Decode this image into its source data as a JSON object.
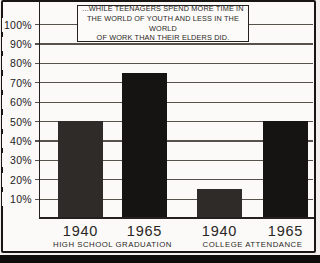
{
  "caption": {
    "full_text": "...WHILE TEENAGERS SPEND MORE TIME IN THE WORLD OF YOUTH AND LESS IN THE WORLD OF WORK THAN THEIR ELDERS DID."
  },
  "chart_data": {
    "type": "bar",
    "title": "...WHILE TEENAGERS SPEND MORE TIME IN THE WORLD OF YOUTH AND LESS IN THE WORLD OF WORK THAN THEIR ELDERS DID.",
    "title_lines": [
      "...WHILE TEENAGERS SPEND MORE TIME IN",
      "THE WORLD OF YOUTH AND LESS IN THE WORLD",
      "OF WORK THAN THEIR ELDERS DID."
    ],
    "groups": [
      {
        "label": "HIGH SCHOOL GRADUATION",
        "bars": [
          {
            "year": "1940",
            "value": 50
          },
          {
            "year": "1965",
            "value": 75
          }
        ]
      },
      {
        "label": "COLLEGE ATTENDANCE",
        "bars": [
          {
            "year": "1940",
            "value": 15
          },
          {
            "year": "1965",
            "value": 50
          }
        ]
      }
    ],
    "categories": [
      "1940",
      "1965",
      "1940",
      "1965"
    ],
    "values": [
      50,
      75,
      15,
      50
    ],
    "ylim": [
      0,
      100
    ],
    "yticks": [
      {
        "value": 10,
        "label": "10%"
      },
      {
        "value": 20,
        "label": "20%"
      },
      {
        "value": 30,
        "label": "30%"
      },
      {
        "value": 40,
        "label": "40%"
      },
      {
        "value": 50,
        "label": "50%"
      },
      {
        "value": 60,
        "label": "60%"
      },
      {
        "value": 70,
        "label": "70%"
      },
      {
        "value": 80,
        "label": "80%"
      },
      {
        "value": 90,
        "label": "90%"
      },
      {
        "value": 100,
        "label": "100%"
      }
    ],
    "grid": true,
    "legend": "none",
    "colors": {
      "bar_1940": "#2e2b29",
      "bar_1965": "#161413",
      "grid_line": "#57524c",
      "axis_line": "#23201d",
      "paper": "#fbfaf8",
      "frame": "#181512"
    }
  }
}
